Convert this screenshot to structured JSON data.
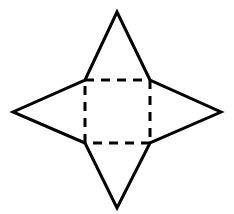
{
  "figure": {
    "name": "net-of-square-pyramid",
    "background_color": "#FFFFFF",
    "stroke_color": "#000000",
    "solid_stroke_width": 3,
    "dashed_stroke_width": 3,
    "dash_pattern": "9 7",
    "canvas": {
      "width": 234,
      "height": 214
    },
    "square": {
      "name": "inner-square",
      "line_style": "dashed",
      "corners": {
        "top_left": {
          "x": 85,
          "y": 80
        },
        "top_right": {
          "x": 150,
          "y": 80
        },
        "bottom_right": {
          "x": 150,
          "y": 143
        },
        "bottom_left": {
          "x": 85,
          "y": 143
        }
      },
      "side_length": 65
    },
    "star_outline": {
      "name": "star-outline",
      "line_style": "solid",
      "points": [
        {
          "label": "top-tip",
          "x": 117,
          "y": 12
        },
        {
          "label": "square-top-right",
          "x": 150,
          "y": 80
        },
        {
          "label": "right-tip",
          "x": 221,
          "y": 112
        },
        {
          "label": "square-bottom-right",
          "x": 150,
          "y": 143
        },
        {
          "label": "bottom-tip",
          "x": 117,
          "y": 208
        },
        {
          "label": "square-bottom-left",
          "x": 85,
          "y": 143
        },
        {
          "label": "left-tip",
          "x": 13,
          "y": 112
        },
        {
          "label": "square-top-left",
          "x": 85,
          "y": 80
        }
      ]
    },
    "triangles": [
      {
        "name": "triangle-top",
        "apex": {
          "x": 117,
          "y": 12
        }
      },
      {
        "name": "triangle-right",
        "apex": {
          "x": 221,
          "y": 112
        }
      },
      {
        "name": "triangle-bottom",
        "apex": {
          "x": 117,
          "y": 208
        }
      },
      {
        "name": "triangle-left",
        "apex": {
          "x": 13,
          "y": 112
        }
      }
    ]
  }
}
